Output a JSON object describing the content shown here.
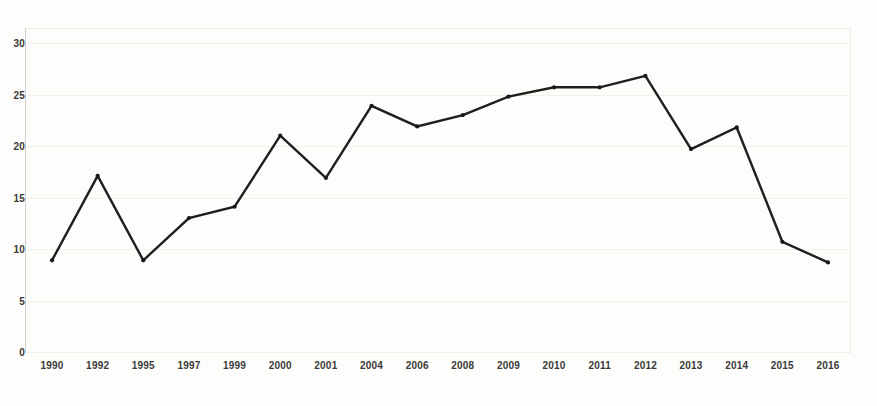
{
  "chart_data": {
    "type": "line",
    "title": "",
    "subtitle": "",
    "xlabel": "",
    "ylabel": "",
    "categories": [
      "1990",
      "1992",
      "1995",
      "1997",
      "1999",
      "2000",
      "2001",
      "2004",
      "2006",
      "2008",
      "2009",
      "2010",
      "2011",
      "2012",
      "2013",
      "2014",
      "2015",
      "2016"
    ],
    "values": [
      8.9,
      17.1,
      8.9,
      13.0,
      14.1,
      21.0,
      16.9,
      23.9,
      21.9,
      23.0,
      24.8,
      25.7,
      25.7,
      26.8,
      19.7,
      21.8,
      10.7,
      8.7
    ],
    "series": [
      {
        "name": "series-1",
        "values": [
          8.9,
          17.1,
          8.9,
          13.0,
          14.1,
          21.0,
          16.9,
          23.9,
          21.9,
          23.0,
          24.8,
          25.7,
          25.7,
          26.8,
          19.7,
          21.8,
          10.7,
          8.7
        ],
        "color": "#211f1d",
        "marker": "dot"
      }
    ],
    "ylim": [
      0,
      30
    ],
    "yticks": [
      0,
      5,
      10,
      15,
      20,
      25,
      30
    ],
    "ytick_labels": [
      "0",
      "5",
      "10",
      "15",
      "20",
      "25",
      "30"
    ],
    "xtick_labels": [
      "1990",
      "1992",
      "1995",
      "1997",
      "1999",
      "2000",
      "2001",
      "2004",
      "2006",
      "2008",
      "2009",
      "2010",
      "2011",
      "2012",
      "2013",
      "2014",
      "2015",
      "2016"
    ],
    "grid": true,
    "grid_axis": "y",
    "legend": null,
    "legend_position": "none",
    "annotations": [],
    "background_color": "#fdfdfb",
    "line_color": "#211f1d",
    "grid_color": "#f1efe9",
    "axis_color": "#cfcfc9",
    "tick_label_color": "#3a3a38"
  }
}
